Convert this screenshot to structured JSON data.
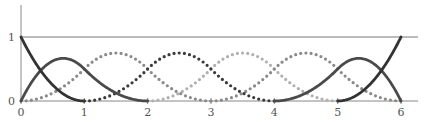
{
  "chart_data": {
    "type": "line",
    "title": "",
    "xlabel": "",
    "ylabel": "",
    "xlim": [
      0,
      6
    ],
    "ylim": [
      0,
      1
    ],
    "x_ticks": [
      "0",
      "1",
      "2",
      "3",
      "4",
      "5",
      "6"
    ],
    "y_ticks": [
      "0",
      "1"
    ],
    "grid": false,
    "legend": null,
    "knots": [
      0,
      0,
      0,
      1,
      2,
      3,
      4,
      5,
      6,
      6,
      6
    ],
    "degree": 2,
    "series": [
      {
        "name": "N0",
        "style": "solid",
        "color": "#333333",
        "support": [
          0,
          1
        ],
        "peak": {
          "x": 0,
          "y": 1
        }
      },
      {
        "name": "N1",
        "style": "solid",
        "color": "#4a4a4a",
        "support": [
          0,
          2
        ],
        "peak": {
          "x": 0.67,
          "y": 0.67
        }
      },
      {
        "name": "N2",
        "style": "dotted",
        "color": "#8a8a8a",
        "support": [
          0,
          3
        ],
        "peak": {
          "x": 1.5,
          "y": 0.75
        }
      },
      {
        "name": "N3",
        "style": "dotted",
        "color": "#3a3a3a",
        "support": [
          1,
          4
        ],
        "peak": {
          "x": 2.5,
          "y": 0.75
        }
      },
      {
        "name": "N4",
        "style": "dotted",
        "color": "#b0b0b0",
        "support": [
          2,
          5
        ],
        "peak": {
          "x": 3.5,
          "y": 0.75
        }
      },
      {
        "name": "N5",
        "style": "dotted",
        "color": "#8a8a8a",
        "support": [
          3,
          6
        ],
        "peak": {
          "x": 4.5,
          "y": 0.75
        }
      },
      {
        "name": "N6",
        "style": "solid",
        "color": "#4a4a4a",
        "support": [
          4,
          6
        ],
        "peak": {
          "x": 5.33,
          "y": 0.67
        }
      },
      {
        "name": "N7",
        "style": "solid",
        "color": "#333333",
        "support": [
          5,
          6
        ],
        "peak": {
          "x": 6,
          "y": 1
        }
      }
    ]
  },
  "axes": {
    "x_ticks": [
      "0",
      "1",
      "2",
      "3",
      "4",
      "5",
      "6"
    ],
    "y_ticks": [
      "0",
      "1"
    ]
  }
}
